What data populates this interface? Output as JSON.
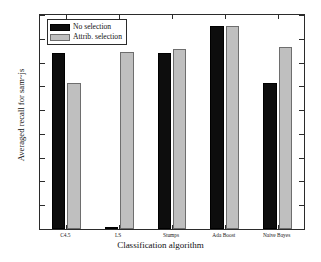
{
  "chart_data": {
    "type": "bar",
    "title": "",
    "xlabel": "Classification algorithm",
    "ylabel": "Averaged recall for sam~js",
    "categories": [
      "C4.5",
      "LS",
      "Stumps",
      "Ada Boost",
      "Naive Bayes"
    ],
    "series": [
      {
        "name": "No selection",
        "color": "#0d0d0d",
        "values": [
          0.74,
          0.005,
          0.74,
          0.855,
          0.613
        ]
      },
      {
        "name": "Attrib. selection",
        "color": "#bfbfbf",
        "values": [
          0.615,
          0.745,
          0.758,
          0.855,
          0.765
        ]
      }
    ],
    "ylim": [
      0,
      0.9
    ],
    "ytick_labels": [
      "0",
      "0.1",
      "0.2",
      "0.3",
      "0.4",
      "0.5",
      "0.6",
      "0.7",
      "0.8",
      "0.9"
    ],
    "ytick_values": [
      0,
      0.1,
      0.2,
      0.3,
      0.4,
      0.5,
      0.6,
      0.7,
      0.8,
      0.9
    ],
    "grid": false,
    "legend_position": "top-left",
    "legend_entries": [
      "No selection",
      "Attrib. selection"
    ]
  }
}
